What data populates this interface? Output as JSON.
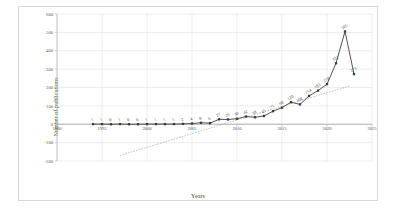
{
  "chart_data": {
    "type": "line",
    "title": "",
    "xlabel": "Years",
    "ylabel": "Number of publications",
    "xlim": [
      1990,
      2025
    ],
    "ylim": [
      -200,
      600
    ],
    "grid": true,
    "legend": false,
    "x_ticks": [
      "1990",
      "1995",
      "2000",
      "2005",
      "2010",
      "2015",
      "2020",
      "2025"
    ],
    "x_tick_values": [
      1990,
      1995,
      2000,
      2005,
      2010,
      2015,
      2020,
      2025
    ],
    "y_ticks": [
      "600",
      "500",
      "400",
      "300",
      "200",
      "100",
      "0",
      "-100",
      "-200"
    ],
    "y_tick_values": [
      600,
      500,
      400,
      300,
      200,
      100,
      0,
      -100,
      -200
    ],
    "x": [
      1994,
      1995,
      1996,
      1997,
      1998,
      1999,
      2000,
      2001,
      2002,
      2003,
      2004,
      2005,
      2006,
      2007,
      2008,
      2009,
      2010,
      2011,
      2012,
      2013,
      2014,
      2015,
      2016,
      2017,
      2018,
      2019,
      2020,
      2021,
      2022,
      2023
    ],
    "values": [
      1,
      1,
      0,
      1,
      0,
      0,
      1,
      1,
      1,
      1,
      2,
      4,
      8,
      6,
      27,
      26,
      30,
      42,
      38,
      45,
      71,
      90,
      120,
      108,
      154,
      183,
      218,
      332,
      505,
      273
    ],
    "point_labels": [
      "1",
      "1",
      "0",
      "1",
      "0",
      "0",
      "1",
      "1",
      "1",
      "1",
      "2",
      "4",
      "8",
      "6",
      "27",
      "26",
      "30",
      "42",
      "38",
      "45",
      "71",
      "90",
      "120",
      "108",
      "154",
      "183",
      "218",
      "332",
      "505",
      "273"
    ],
    "series": [
      {
        "name": "Number of publications",
        "marker": "square",
        "color": "#3a3a3a",
        "values": [
          1,
          1,
          0,
          1,
          0,
          0,
          1,
          1,
          1,
          1,
          2,
          4,
          8,
          6,
          27,
          26,
          30,
          42,
          38,
          45,
          71,
          90,
          120,
          108,
          154,
          183,
          218,
          332,
          505,
          273
        ]
      }
    ],
    "trendline": {
      "type": "linear",
      "style": "dotted",
      "color": "#9a9a9a",
      "x_start": 1997.0,
      "y_start": -170,
      "x_end": 2022.6,
      "y_end": 210
    }
  }
}
